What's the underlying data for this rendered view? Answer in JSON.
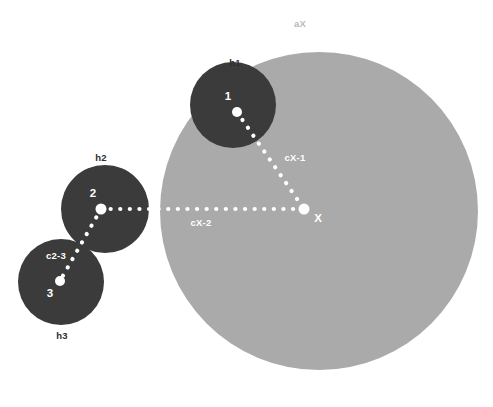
{
  "canvas": {
    "width": 493,
    "height": 407,
    "background": "#ffffff"
  },
  "colors": {
    "big_circle": "#aaaaaa",
    "small_circle": "#3b3b3b",
    "node_dot": "#ffffff",
    "label_dark": "#2e2e2e",
    "label_light": "#b9b9b9",
    "label_white": "#ffffff",
    "dotted_line": "#ffffff"
  },
  "chart_data": {
    "type": "scatter",
    "title": "",
    "circles": [
      {
        "id": "aX",
        "label": "aX",
        "cx": 319,
        "cy": 211,
        "r": 159,
        "fill": "#aaaaaa",
        "label_x": 300,
        "label_y": 27,
        "label_color": "#b9b9b9"
      },
      {
        "id": "h1",
        "label": "h1",
        "cx": 233,
        "cy": 105,
        "r": 43,
        "fill": "#3b3b3b",
        "label_x": 235,
        "label_y": 66,
        "label_color": "#2e2e2e"
      },
      {
        "id": "h2",
        "label": "h2",
        "cx": 105,
        "cy": 209,
        "r": 44,
        "fill": "#3b3b3b",
        "label_x": 101,
        "label_y": 161,
        "label_color": "#2e2e2e"
      },
      {
        "id": "h3",
        "label": "h3",
        "cx": 61,
        "cy": 282,
        "r": 43,
        "fill": "#3b3b3b",
        "label_x": 62,
        "label_y": 339,
        "label_color": "#2e2e2e"
      }
    ],
    "nodes": [
      {
        "id": "1",
        "label": "1",
        "x": 237,
        "y": 112,
        "label_x": 228,
        "label_y": 100,
        "dot_r": 5
      },
      {
        "id": "2",
        "label": "2",
        "x": 101,
        "y": 209,
        "label_x": 93,
        "label_y": 197,
        "dot_r": 5.5
      },
      {
        "id": "3",
        "label": "3",
        "x": 60,
        "y": 281,
        "label_x": 50,
        "label_y": 297,
        "dot_r": 5
      },
      {
        "id": "X",
        "label": "X",
        "x": 304,
        "y": 209,
        "label_x": 318,
        "label_y": 222,
        "dot_r": 5.5
      }
    ],
    "connectors": [
      {
        "id": "cX-1",
        "label": "cX-1",
        "from": "1",
        "to": "X",
        "x1": 237,
        "y1": 112,
        "x2": 304,
        "y2": 209,
        "label_x": 295,
        "label_y": 161,
        "style": "dotted",
        "color": "#ffffff"
      },
      {
        "id": "cX-2",
        "label": "cX-2",
        "from": "2",
        "to": "X",
        "x1": 101,
        "y1": 209,
        "x2": 304,
        "y2": 209,
        "label_x": 201,
        "label_y": 226,
        "style": "dotted",
        "color": "#ffffff"
      },
      {
        "id": "c2-3",
        "label": "c2-3",
        "from": "2",
        "to": "3",
        "x1": 101,
        "y1": 209,
        "x2": 60,
        "y2": 281,
        "label_x": 56,
        "label_y": 259,
        "style": "dotted",
        "color": "#ffffff"
      }
    ],
    "legend": {
      "entries": []
    },
    "grid": false
  }
}
